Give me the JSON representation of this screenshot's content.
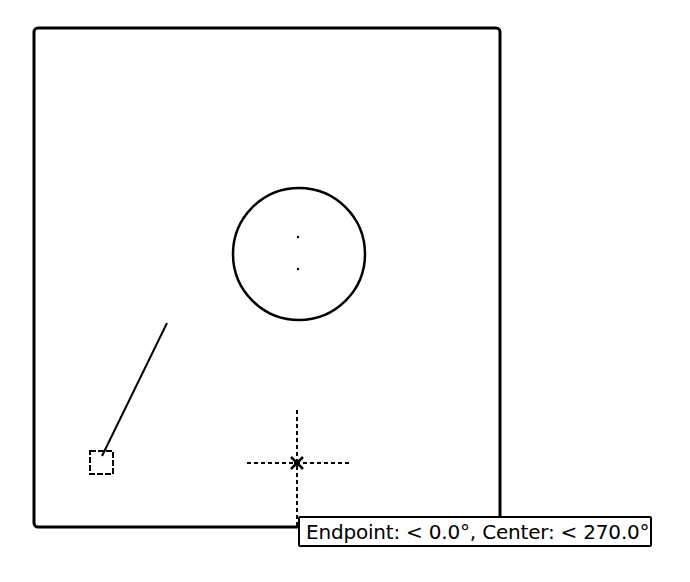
{
  "viewport": {
    "frame": {
      "x": 34,
      "y": 28,
      "width": 466,
      "height": 499,
      "corner_radius": 4
    },
    "circle": {
      "cx": 299,
      "cy": 254,
      "r": 65
    },
    "center_marks": [
      {
        "x": 298,
        "y": 237
      },
      {
        "x": 298,
        "y": 269
      }
    ],
    "line": {
      "x1": 167,
      "y1": 323,
      "x2": 102,
      "y2": 456
    },
    "endpoint_marker": {
      "x": 90,
      "y": 451,
      "size": 23
    },
    "crosshair": {
      "cx": 297,
      "cy": 463,
      "h_from": 247,
      "h_to": 349,
      "v_from": 410,
      "v_to": 528
    }
  },
  "tooltip": {
    "text": "Endpoint: < 0.0°,  Center: < 270.0°"
  },
  "colors": {
    "stroke": "#000000",
    "background": "#ffffff"
  }
}
